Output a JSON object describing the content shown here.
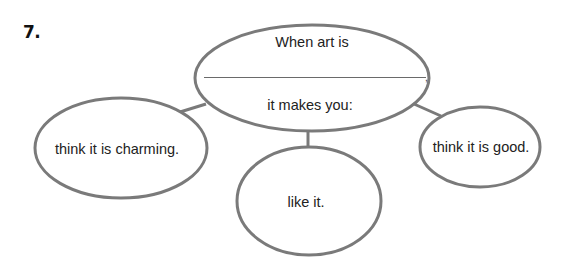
{
  "question": {
    "number": "7."
  },
  "center_node": {
    "line1": "When art is",
    "blank_suffix": ",",
    "line2": "it makes you:"
  },
  "branches": [
    {
      "label": "think it is charming."
    },
    {
      "label": "like it."
    },
    {
      "label": "think it is good."
    }
  ],
  "colors": {
    "stroke": "#7a7a7a",
    "text": "#222222"
  }
}
